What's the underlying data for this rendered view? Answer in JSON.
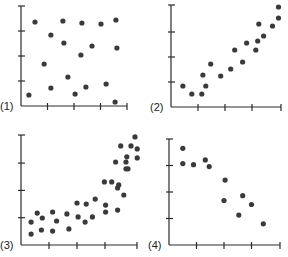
{
  "chart_data": [
    {
      "type": "scatter",
      "label": "(1)",
      "title": "",
      "xlabel": "",
      "ylabel": "",
      "xlim": [
        0,
        4
      ],
      "ylim": [
        0,
        4
      ],
      "grid": false,
      "description": "No correlation",
      "points": [
        [
          0.53,
          3.36
        ],
        [
          1.58,
          3.4
        ],
        [
          2.3,
          3.32
        ],
        [
          3.02,
          3.28
        ],
        [
          3.58,
          3.44
        ],
        [
          1.13,
          2.84
        ],
        [
          1.62,
          2.52
        ],
        [
          3.62,
          2.32
        ],
        [
          2.68,
          2.4
        ],
        [
          2.26,
          2.04
        ],
        [
          0.87,
          1.68
        ],
        [
          1.77,
          1.16
        ],
        [
          1.13,
          0.72
        ],
        [
          2.45,
          0.76
        ],
        [
          2.04,
          0.48
        ],
        [
          3.21,
          0.88
        ],
        [
          0.3,
          0.44
        ],
        [
          3.55,
          0.16
        ]
      ]
    },
    {
      "type": "scatter",
      "label": "(2)",
      "title": "",
      "xlabel": "",
      "ylabel": "",
      "xlim": [
        0,
        4
      ],
      "ylim": [
        0,
        4
      ],
      "grid": false,
      "description": "Strong positive linear correlation",
      "points": [
        [
          0.44,
          0.84
        ],
        [
          0.77,
          0.52
        ],
        [
          1.14,
          0.52
        ],
        [
          1.18,
          1.28
        ],
        [
          1.29,
          0.84
        ],
        [
          1.47,
          1.72
        ],
        [
          1.84,
          1.24
        ],
        [
          2.21,
          1.52
        ],
        [
          2.36,
          2.28
        ],
        [
          2.65,
          1.8
        ],
        [
          2.8,
          2.56
        ],
        [
          3.14,
          2.28
        ],
        [
          3.21,
          2.64
        ],
        [
          3.25,
          3.32
        ],
        [
          3.43,
          2.84
        ],
        [
          3.76,
          3.24
        ],
        [
          3.98,
          3.56
        ],
        [
          3.98,
          4.0
        ]
      ]
    },
    {
      "type": "scatter",
      "label": "(3)",
      "title": "",
      "xlabel": "",
      "ylabel": "",
      "xlim": [
        0,
        4
      ],
      "ylim": [
        0,
        4
      ],
      "grid": false,
      "description": "Non-linear (curved) positive relationship",
      "points": [
        [
          0.36,
          0.84
        ],
        [
          0.36,
          0.4
        ],
        [
          0.58,
          1.17
        ],
        [
          0.76,
          0.99
        ],
        [
          0.73,
          0.55
        ],
        [
          1.13,
          0.51
        ],
        [
          1.13,
          1.21
        ],
        [
          1.27,
          0.88
        ],
        [
          1.64,
          1.14
        ],
        [
          1.71,
          0.59
        ],
        [
          2.0,
          1.54
        ],
        [
          2.04,
          1.03
        ],
        [
          2.29,
          0.84
        ],
        [
          2.33,
          1.5
        ],
        [
          2.55,
          1.03
        ],
        [
          2.65,
          1.68
        ],
        [
          3.02,
          1.21
        ],
        [
          3.02,
          1.46
        ],
        [
          2.98,
          2.31
        ],
        [
          3.24,
          2.31
        ],
        [
          3.45,
          2.09
        ],
        [
          3.45,
          1.28
        ],
        [
          3.49,
          2.2
        ],
        [
          3.67,
          1.83
        ],
        [
          3.38,
          3.04
        ],
        [
          3.56,
          3.63
        ],
        [
          3.75,
          3.04
        ],
        [
          3.78,
          3.23
        ],
        [
          3.82,
          2.79
        ],
        [
          3.75,
          2.79
        ],
        [
          3.93,
          3.63
        ],
        [
          4.07,
          3.96
        ],
        [
          4.15,
          3.52
        ],
        [
          4.15,
          3.19
        ]
      ]
    },
    {
      "type": "scatter",
      "label": "(4)",
      "title": "",
      "xlabel": "",
      "ylabel": "",
      "xlim": [
        0,
        4
      ],
      "ylim": [
        0,
        4
      ],
      "grid": false,
      "description": "Negative correlation",
      "points": [
        [
          0.5,
          3.65
        ],
        [
          0.5,
          3.07
        ],
        [
          0.89,
          3.03
        ],
        [
          1.32,
          3.21
        ],
        [
          1.46,
          2.96
        ],
        [
          2.04,
          2.45
        ],
        [
          2.0,
          1.68
        ],
        [
          2.68,
          1.86
        ],
        [
          2.54,
          1.13
        ],
        [
          3.0,
          1.53
        ],
        [
          3.43,
          0.8
        ]
      ]
    }
  ],
  "panels": [
    {
      "label": "(1)",
      "origin": [
        21,
        106
      ],
      "xstep": 26.5,
      "ystep": 25.0,
      "ytop": 6,
      "xend": 127
    },
    {
      "label": "(2)",
      "origin": [
        171,
        107
      ],
      "xstep": 27.0,
      "ystep": 25.0,
      "ytop": 5,
      "xend": 281
    },
    {
      "label": "(3)",
      "origin": [
        21,
        245
      ],
      "xstep": 28.0,
      "ystep": 27.3,
      "ytop": 135,
      "xend": 137
    },
    {
      "label": "(4)",
      "origin": [
        169,
        245
      ],
      "xstep": 27.5,
      "ystep": 26.5,
      "ytop": 139,
      "xend": 280
    }
  ],
  "colors": {
    "axis": "#2a2a2a",
    "dot": "#3a3a3a",
    "background": "#ffffff"
  }
}
